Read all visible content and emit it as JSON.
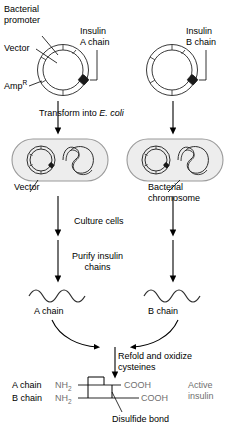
{
  "diagram": {
    "colors": {
      "stroke": "#000000",
      "cell_fill": "#ededed",
      "cell_stroke": "#9a9a9a",
      "plasmid_stroke": "#3a3a3a",
      "insert_fill": "#1a1a1a",
      "chain_gray": "#6f6f6f",
      "background": "#ffffff"
    },
    "labels": {
      "bacterial_promoter": "Bacterial\npromoter",
      "vector_top": "Vector",
      "amp_resistance": "Amp",
      "amp_superscript": "R",
      "insulin_a_chain": "Insulin\nA chain",
      "insulin_b_chain": "Insulin\nB chain",
      "transform_pre": "Transform into ",
      "transform_species": "E. coli",
      "vector_cell": "Vector",
      "bacterial_chromosome": "Bacterial\nchromosome",
      "culture_cells": "Culture cells",
      "purify_insulin_chains": "Purify insulin\nchains",
      "a_chain": "A chain",
      "b_chain": "B chain",
      "refold_oxidize": "Refold and oxidize\ncysteines",
      "final_a_chain": "A chain",
      "final_b_chain": "B chain",
      "nh2_a": "NH",
      "nh2_a_sub": "2",
      "nh2_b": "NH",
      "nh2_b_sub": "2",
      "cooh_a": "COOH",
      "cooh_b": "COOH",
      "disulfide_bond": "Disulfide bond",
      "active_insulin": "Active\ninsulin"
    },
    "steps": [
      "Construct vectors carrying insulin A chain and B chain genes",
      "Transform into E. coli",
      "Culture cells",
      "Purify insulin chains",
      "Refold and oxidize cysteines",
      "Active insulin"
    ]
  }
}
